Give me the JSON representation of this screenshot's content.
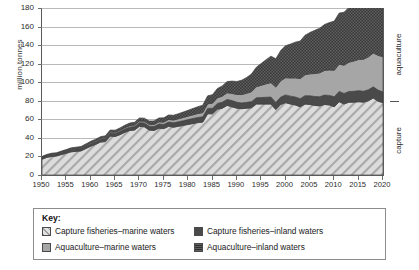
{
  "chart_data": {
    "type": "area",
    "title": "",
    "subtitle": "",
    "xlabel": "",
    "ylabel": "million tonnes",
    "xlim": [
      1950,
      2020
    ],
    "ylim": [
      0,
      180
    ],
    "grid": true,
    "stacked": true,
    "legend_position": "bottom",
    "legend_title": "Key:",
    "ytick_labels": [
      "180",
      "160",
      "140",
      "120",
      "100",
      "80",
      "60",
      "40",
      "20",
      "0"
    ],
    "ytick_values": [
      180,
      160,
      140,
      120,
      100,
      80,
      60,
      40,
      20,
      0
    ],
    "xtick_labels": [
      "1950",
      "1955",
      "1960",
      "1965",
      "1970",
      "1975",
      "1980",
      "1985",
      "1990",
      "1995",
      "2000",
      "2005",
      "2010",
      "2015",
      "2020"
    ],
    "xtick_values": [
      1950,
      1955,
      1960,
      1965,
      1970,
      1975,
      1980,
      1985,
      1990,
      1995,
      2000,
      2005,
      2010,
      2015,
      2020
    ],
    "annotations": [
      {
        "text": "aquaculture",
        "position": "right-axis-upper"
      },
      {
        "text": "capture",
        "position": "right-axis-lower"
      }
    ],
    "x": [
      1950,
      1951,
      1952,
      1953,
      1954,
      1955,
      1956,
      1957,
      1958,
      1959,
      1960,
      1961,
      1962,
      1963,
      1964,
      1965,
      1966,
      1967,
      1968,
      1969,
      1970,
      1971,
      1972,
      1973,
      1974,
      1975,
      1976,
      1977,
      1978,
      1979,
      1980,
      1981,
      1982,
      1983,
      1984,
      1985,
      1986,
      1987,
      1988,
      1989,
      1990,
      1991,
      1992,
      1993,
      1994,
      1995,
      1996,
      1997,
      1998,
      1999,
      2000,
      2001,
      2002,
      2003,
      2004,
      2005,
      2006,
      2007,
      2008,
      2009,
      2010,
      2011,
      2012,
      2013,
      2014,
      2015,
      2016,
      2017,
      2018,
      2019,
      2020
    ],
    "series": [
      {
        "name": "Capture fisheries–marine waters",
        "pattern": "diagonal-hatch",
        "color": "#d7d7d7",
        "values": [
          17.0,
          19.0,
          20.0,
          20.5,
          22.0,
          23.5,
          25.0,
          25.5,
          26.0,
          28.5,
          31.0,
          33.0,
          35.5,
          36.0,
          42.0,
          41.5,
          43.5,
          46.0,
          48.0,
          48.5,
          52.5,
          52.0,
          48.5,
          48.0,
          50.5,
          50.0,
          52.5,
          51.5,
          52.5,
          53.5,
          54.5,
          55.5,
          56.5,
          57.0,
          66.0,
          66.0,
          71.0,
          72.0,
          75.0,
          73.5,
          72.0,
          71.5,
          72.0,
          72.5,
          76.5,
          76.5,
          76.5,
          76.5,
          70.5,
          76.0,
          78.0,
          76.5,
          75.5,
          73.5,
          76.5,
          76.0,
          75.0,
          74.5,
          76.0,
          75.5,
          73.5,
          79.0,
          76.5,
          78.5,
          78.5,
          79.0,
          78.5,
          80.0,
          83.0,
          79.5,
          78.0
        ]
      },
      {
        "name": "Capture fisheries–inland waters",
        "pattern": "solid-dark",
        "color": "#4a4a4a",
        "values": [
          2.0,
          2.1,
          2.2,
          2.2,
          2.3,
          2.4,
          2.5,
          2.6,
          2.6,
          2.7,
          2.8,
          2.9,
          3.0,
          3.1,
          3.2,
          3.3,
          3.4,
          3.5,
          3.6,
          3.7,
          3.9,
          4.0,
          4.1,
          4.2,
          4.4,
          4.5,
          4.6,
          4.8,
          4.9,
          5.0,
          5.2,
          5.4,
          5.5,
          5.7,
          5.8,
          6.0,
          6.2,
          6.4,
          6.5,
          6.7,
          6.4,
          6.2,
          6.3,
          6.5,
          6.7,
          7.0,
          7.3,
          7.5,
          7.7,
          8.0,
          8.3,
          8.5,
          8.6,
          8.8,
          9.0,
          9.4,
          9.6,
          9.9,
          10.1,
          10.3,
          10.8,
          11.1,
          11.4,
          11.5,
          11.7,
          11.9,
          11.8,
          11.9,
          12.0,
          12.0,
          11.5
        ]
      },
      {
        "name": "Aquaculture–marine waters",
        "pattern": "solid-light-gray",
        "color": "#a6a6a6",
        "values": [
          0.4,
          0.4,
          0.5,
          0.5,
          0.6,
          0.6,
          0.7,
          0.7,
          0.8,
          0.9,
          1.0,
          1.0,
          1.1,
          1.2,
          1.3,
          1.3,
          1.4,
          1.5,
          1.6,
          1.7,
          1.8,
          1.9,
          2.0,
          2.2,
          2.4,
          2.6,
          2.8,
          3.0,
          3.2,
          3.5,
          3.8,
          4.0,
          4.3,
          4.6,
          5.0,
          5.4,
          6.0,
          6.6,
          7.2,
          7.8,
          8.4,
          9.0,
          9.8,
          10.8,
          12.0,
          13.2,
          14.5,
          15.6,
          16.6,
          17.6,
          18.6,
          19.6,
          20.6,
          21.6,
          22.6,
          23.7,
          24.8,
          25.8,
          26.6,
          27.5,
          28.6,
          29.4,
          30.5,
          31.6,
          32.7,
          33.6,
          34.5,
          35.5,
          36.5,
          37.5,
          38.0
        ]
      },
      {
        "name": "Aquaculture–inland waters",
        "pattern": "dotted-dark",
        "color": "#3c3c3c",
        "values": [
          0.6,
          0.7,
          0.8,
          0.8,
          0.9,
          1.0,
          1.1,
          1.2,
          1.3,
          1.4,
          1.5,
          1.6,
          1.7,
          1.9,
          2.0,
          2.2,
          2.4,
          2.6,
          2.8,
          3.0,
          3.2,
          3.4,
          3.6,
          3.9,
          4.2,
          4.5,
          4.8,
          5.1,
          5.5,
          5.9,
          6.3,
          6.8,
          7.3,
          7.9,
          8.5,
          9.2,
          10.0,
          11.0,
          12.0,
          13.2,
          14.0,
          15.5,
          17.0,
          19.0,
          21.0,
          23.5,
          26.0,
          28.5,
          30.5,
          32.5,
          34.5,
          36.5,
          38.5,
          40.5,
          42.5,
          44.5,
          46.5,
          48.0,
          49.5,
          51.0,
          53.0,
          55.0,
          57.0,
          59.0,
          61.0,
          63.0,
          65.0,
          67.5,
          69.5,
          71.0,
          72.0
        ]
      }
    ]
  },
  "axis": {
    "y_title": "million tonnes",
    "right_upper_label": "aquaculture",
    "right_lower_label": "capture"
  },
  "legend": {
    "title": "Key:",
    "items": [
      {
        "label": "Capture fisheries–marine waters",
        "swatch": "hatch-swatch",
        "color": "#d7d7d7"
      },
      {
        "label": "Capture fisheries–inland waters",
        "swatch": "dark-solid-swatch",
        "color": "#4a4a4a"
      },
      {
        "label": "Aquaculture–marine waters",
        "swatch": "gray-solid-swatch",
        "color": "#a6a6a6"
      },
      {
        "label": "Aquaculture–inland waters",
        "swatch": "dark-dotted-swatch",
        "color": "#3c3c3c"
      }
    ]
  }
}
